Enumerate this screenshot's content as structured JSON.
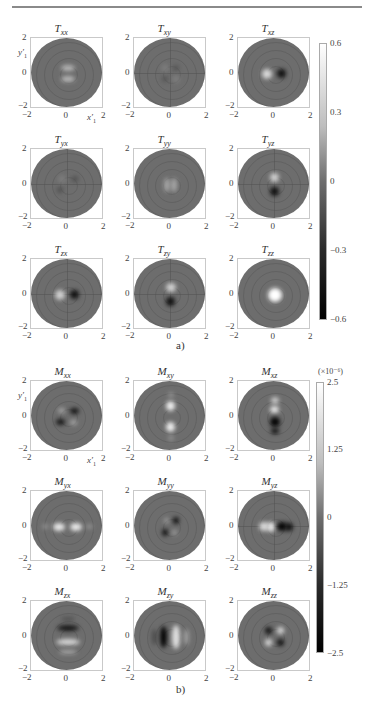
{
  "figure": {
    "caption_a": "a)",
    "caption_b": "b)",
    "axis_tick_min": "−2",
    "axis_tick_mid": "0",
    "axis_tick_max": "2",
    "y_axis_label": "y′",
    "y_axis_sub": "1",
    "x_axis_label": "x′",
    "x_axis_sub": "1"
  },
  "colorbar_a": {
    "ticks": [
      "0.6",
      "0.3",
      "0",
      "−0.3",
      "−0.6"
    ],
    "range": [
      -0.6,
      0.6
    ]
  },
  "colorbar_b": {
    "scale_label": "(×10⁻⁶)",
    "ticks": [
      "2.5",
      "1.25",
      "0",
      "−1.25",
      "−2.5"
    ],
    "range": [
      -2.5e-06,
      2.5e-06
    ]
  },
  "chart_data": [
    {
      "type": "heatmap",
      "title": "T tensor components (panel a)",
      "grid": "3x3",
      "panels": [
        {
          "name": "T",
          "sub": "xx",
          "feature": "two bright lobes above/below center"
        },
        {
          "name": "T",
          "sub": "xy",
          "feature": "faint quadrant pattern"
        },
        {
          "name": "T",
          "sub": "xz",
          "feature": "bright left / dark right of center"
        },
        {
          "name": "T",
          "sub": "yx",
          "feature": "faint quadrant pattern"
        },
        {
          "name": "T",
          "sub": "yy",
          "feature": "bright vertical lobes near center"
        },
        {
          "name": "T",
          "sub": "yz",
          "feature": "bright above / dark below center"
        },
        {
          "name": "T",
          "sub": "zx",
          "feature": "bright left / dark right of center"
        },
        {
          "name": "T",
          "sub": "zy",
          "feature": "bright above / dark below center"
        },
        {
          "name": "T",
          "sub": "zz",
          "feature": "bright spot at center"
        }
      ],
      "xlabel": "x′1",
      "ylabel": "y′1",
      "xlim": [
        -2,
        2
      ],
      "ylim": [
        -2,
        2
      ],
      "colorbar": {
        "min": -0.6,
        "max": 0.6,
        "ticks": [
          0.6,
          0.3,
          0,
          -0.3,
          -0.6
        ]
      }
    },
    {
      "type": "heatmap",
      "title": "M tensor components (panel b)",
      "grid": "3x3",
      "panels": [
        {
          "name": "M",
          "sub": "xx",
          "feature": "quadrupole: dark upper-right & lower-left"
        },
        {
          "name": "M",
          "sub": "xy",
          "feature": "bright lobes above and below center"
        },
        {
          "name": "M",
          "sub": "xz",
          "feature": "bright above / dark below center"
        },
        {
          "name": "M",
          "sub": "yx",
          "feature": "bright lobes left and right of center"
        },
        {
          "name": "M",
          "sub": "yy",
          "feature": "quadrupole: dark upper-right & lower-left"
        },
        {
          "name": "M",
          "sub": "yz",
          "feature": "bright left / dark right of center"
        },
        {
          "name": "M",
          "sub": "zx",
          "feature": "dark arc above, bright arc below center"
        },
        {
          "name": "M",
          "sub": "zy",
          "feature": "dark left / bright right vertical arcs"
        },
        {
          "name": "M",
          "sub": "zz",
          "feature": "quadrupole: dark upper-left & lower-right"
        }
      ],
      "xlabel": "x′1",
      "ylabel": "y′1",
      "xlim": [
        -2,
        2
      ],
      "ylim": [
        -2,
        2
      ],
      "colorbar": {
        "min": -2.5e-06,
        "max": 2.5e-06,
        "ticks": [
          2.5,
          1.25,
          0,
          -1.25,
          -2.5
        ],
        "scale": "×10⁻⁶"
      }
    }
  ]
}
